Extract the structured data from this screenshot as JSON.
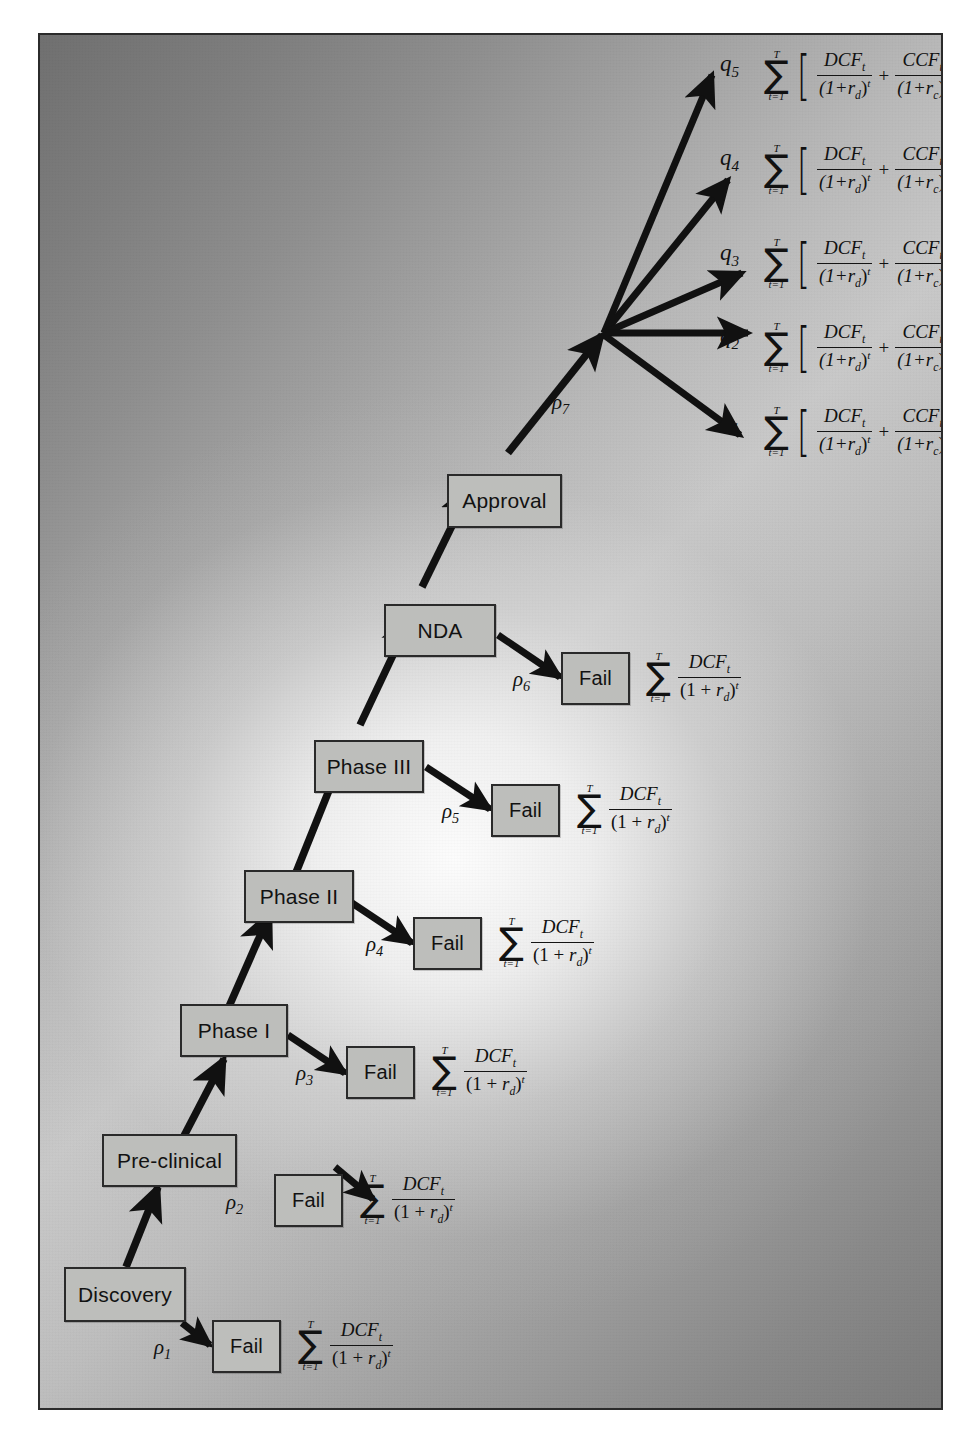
{
  "diagram": {
    "frame_border_color": "#2b2b2b",
    "node_fill_color": "#bdbebb",
    "node_border_color": "#2a2a2a",
    "arrow_color": "#111111"
  },
  "stage_nodes": [
    {
      "id": "discovery",
      "label": "Discovery"
    },
    {
      "id": "pre-clinical",
      "label": "Pre-clinical"
    },
    {
      "id": "phase-i",
      "label": "Phase I"
    },
    {
      "id": "phase-ii",
      "label": "Phase II"
    },
    {
      "id": "phase-iii",
      "label": "Phase III"
    },
    {
      "id": "nda",
      "label": "NDA"
    },
    {
      "id": "approval",
      "label": "Approval"
    }
  ],
  "fail_nodes": [
    {
      "id": "fail-1",
      "label": "Fail"
    },
    {
      "id": "fail-2",
      "label": "Fail"
    },
    {
      "id": "fail-3",
      "label": "Fail"
    },
    {
      "id": "fail-4",
      "label": "Fail"
    },
    {
      "id": "fail-5",
      "label": "Fail"
    },
    {
      "id": "fail-6",
      "label": "Fail"
    }
  ],
  "failure_probabilities": [
    {
      "id": "rho-1",
      "symbol": "ρ",
      "subscript": "1",
      "from": "Discovery",
      "to": "Fail"
    },
    {
      "id": "rho-2",
      "symbol": "ρ",
      "subscript": "2",
      "from": "Pre-clinical",
      "to": "Fail"
    },
    {
      "id": "rho-3",
      "symbol": "ρ",
      "subscript": "3",
      "from": "Phase I",
      "to": "Fail"
    },
    {
      "id": "rho-4",
      "symbol": "ρ",
      "subscript": "4",
      "from": "Phase II",
      "to": "Fail"
    },
    {
      "id": "rho-5",
      "symbol": "ρ",
      "subscript": "5",
      "from": "Phase III",
      "to": "Fail"
    },
    {
      "id": "rho-6",
      "symbol": "ρ",
      "subscript": "6",
      "from": "NDA",
      "to": "Fail"
    },
    {
      "id": "rho-7",
      "symbol": "ρ",
      "subscript": "7",
      "from": "Approval",
      "to": "Market outcomes"
    }
  ],
  "outcome_labels": [
    {
      "id": "q-5",
      "symbol": "q",
      "subscript": "5"
    },
    {
      "id": "q-4",
      "symbol": "q",
      "subscript": "4"
    },
    {
      "id": "q-3",
      "symbol": "q",
      "subscript": "3"
    },
    {
      "id": "q-2",
      "symbol": "q",
      "subscript": "2"
    },
    {
      "id": "q-1",
      "symbol": "q",
      "subscript": "1"
    }
  ],
  "formulas": {
    "fail_formula": {
      "sum_upper": "T",
      "sum_lower": "t=1",
      "sigma": "∑",
      "numerator": "DCF",
      "numerator_sub": "t",
      "denominator_open": "(1 +",
      "denominator_var": "r",
      "denominator_var_sub": "d",
      "denominator_close": ")",
      "denominator_pow": "t",
      "plain": "∑(t=1..T) DCF_t / (1 + r_d)^t"
    },
    "success_formula": {
      "sum_upper": "T",
      "sum_lower": "t=1",
      "sigma": "∑",
      "bracket_open": "[",
      "bracket_close": "]",
      "term1_num": "DCF",
      "term1_num_sub": "t",
      "term1_den_open": "(1+",
      "term1_den_var": "r",
      "term1_den_var_sub": "d",
      "term1_den_close": ")",
      "term1_den_pow": "t",
      "operator": "+",
      "term2_num": "CCF",
      "term2_num_sub": "t",
      "term2_den_open": "(1+",
      "term2_den_var": "r",
      "term2_den_var_sub": "c",
      "term2_den_close": ")",
      "term2_den_pow": "t",
      "plain": "∑(t=1..T) [ DCF_t/(1+r_d)^t + CCF_t/(1+r_c)^t ]"
    }
  },
  "success_formula_instances": [
    "q5",
    "q4",
    "q3",
    "q2",
    "q1"
  ],
  "fail_formula_instances": [
    "fail1",
    "fail2",
    "fail3",
    "fail4",
    "fail5",
    "fail6"
  ]
}
